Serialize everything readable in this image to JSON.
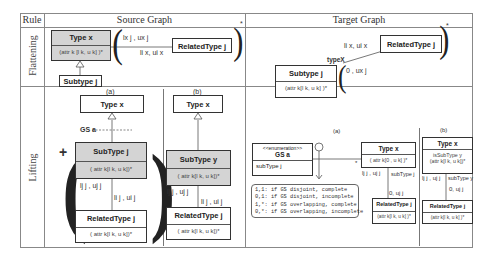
{
  "table": {
    "headers": {
      "rule": "Rule",
      "source": "Source Graph",
      "target": "Target Graph"
    },
    "rows": [
      {
        "rule": "Flattening"
      },
      {
        "rule": "Lifting"
      }
    ]
  },
  "flattening": {
    "source": {
      "type_box": {
        "title": "Type x",
        "attrs": "(attr k [l k, u k] )*"
      },
      "subtype_box": {
        "title": "Subtype j"
      },
      "related_box": {
        "title": "RelatedType j"
      },
      "edge_label_top": "lx j , ux j",
      "edge_label_bottom": "li x, ui x",
      "multiplicity": "*"
    },
    "target": {
      "subtype_box": {
        "title": "Subtype j",
        "attrs": "(attr k[l k, u k] )*"
      },
      "related_box": {
        "title": "RelatedType j"
      },
      "role_label": "typeX",
      "edge_label_near": "0 , ux j",
      "edge_label_far": "li x, ui x",
      "multiplicity": "*"
    }
  },
  "lifting": {
    "source_a": {
      "caption": "(a)",
      "type_box": {
        "title": "Type x"
      },
      "gs_label": "GS a",
      "subtype_box": {
        "title": "SubType j",
        "attrs": "( attr k[l k, u k])*"
      },
      "related_box": {
        "title": "RelatedType j",
        "attrs": "( attr k[l k, u k])*"
      },
      "edge_label_left": "lj j , uj j",
      "edge_label_right": "li j , ui j",
      "plus": "+"
    },
    "source_b": {
      "caption": "(b)",
      "type_box": {
        "title": "Type x"
      },
      "subtype_box": {
        "title": "SubType y",
        "attrs": "( attr k[l k, u k])*"
      },
      "related_box": {
        "title": "RelatedType j",
        "attrs": "( attr k[l k, u k])*"
      },
      "edge_label_left": "lj j , uj j",
      "edge_label_right": "li j , ui j"
    },
    "target_a": {
      "caption": "(a)",
      "enum_box": {
        "stereotype": "<<enumeration>>",
        "title": "GS a",
        "literal": "subType j"
      },
      "type_box": {
        "title": "Type x",
        "attrs": "( attr k[0 , u k] )*"
      },
      "related_box": {
        "title": "RelatedType j",
        "attrs": "(attr k[l k, u k] )*"
      },
      "edge_label_left": "lj j , uj j",
      "edge_label_role": "subType j",
      "edge_label_bottom": "0, uj j",
      "star": "*",
      "note_lines": [
        "1,1: if GS disjoint, complete",
        "0,1: if GS disjoint, incomplete",
        "1,*: if GS overlapping, complete",
        "0,*: if GS overlapping, incomplete"
      ]
    },
    "target_b": {
      "caption": "(b)",
      "type_box": {
        "title": "Type x",
        "attrs_1": "isSubType y",
        "attrs_2": "(attr k[l k, u k])*"
      },
      "related_box": {
        "title": "RelatedType j",
        "attrs": "(attr k[l k, u k] )*"
      },
      "edge_label_left": "lj j , uj j",
      "edge_label_role": "subType y",
      "edge_label_bottom": "0, uj j"
    }
  }
}
